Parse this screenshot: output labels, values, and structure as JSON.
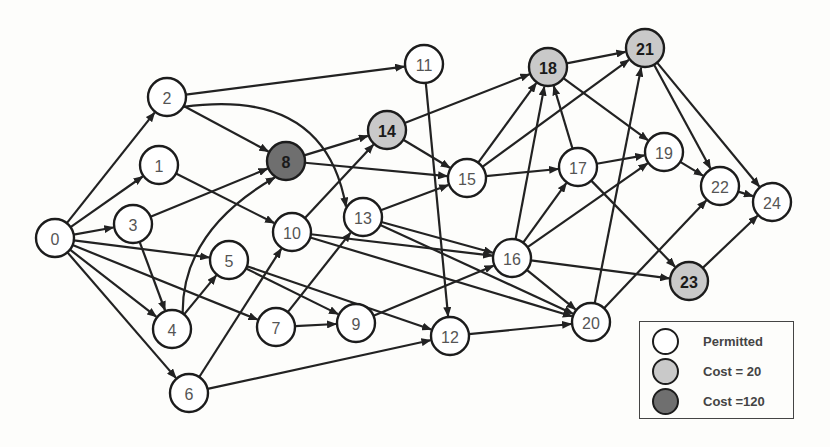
{
  "colors": {
    "permitted": "#ffffff",
    "cost20": "#c9c9c9",
    "cost120": "#6f6f6f",
    "edge": "#222222"
  },
  "nodes": [
    {
      "id": "0",
      "x": 55,
      "y": 238,
      "type": "permitted"
    },
    {
      "id": "1",
      "x": 159,
      "y": 165,
      "type": "permitted"
    },
    {
      "id": "2",
      "x": 167,
      "y": 97,
      "type": "permitted"
    },
    {
      "id": "3",
      "x": 133,
      "y": 224,
      "type": "permitted"
    },
    {
      "id": "4",
      "x": 172,
      "y": 329,
      "type": "permitted"
    },
    {
      "id": "5",
      "x": 229,
      "y": 260,
      "type": "permitted"
    },
    {
      "id": "6",
      "x": 189,
      "y": 393,
      "type": "permitted"
    },
    {
      "id": "7",
      "x": 276,
      "y": 327,
      "type": "permitted"
    },
    {
      "id": "8",
      "x": 286,
      "y": 161,
      "type": "cost120"
    },
    {
      "id": "9",
      "x": 356,
      "y": 323,
      "type": "permitted"
    },
    {
      "id": "10",
      "x": 292,
      "y": 232,
      "type": "permitted"
    },
    {
      "id": "11",
      "x": 424,
      "y": 64,
      "type": "permitted"
    },
    {
      "id": "12",
      "x": 450,
      "y": 336,
      "type": "permitted"
    },
    {
      "id": "13",
      "x": 363,
      "y": 217,
      "type": "permitted"
    },
    {
      "id": "14",
      "x": 387,
      "y": 130,
      "type": "cost20"
    },
    {
      "id": "15",
      "x": 467,
      "y": 178,
      "type": "permitted"
    },
    {
      "id": "16",
      "x": 512,
      "y": 258,
      "type": "permitted"
    },
    {
      "id": "17",
      "x": 578,
      "y": 167,
      "type": "permitted"
    },
    {
      "id": "18",
      "x": 548,
      "y": 67,
      "type": "cost20"
    },
    {
      "id": "19",
      "x": 664,
      "y": 152,
      "type": "permitted"
    },
    {
      "id": "20",
      "x": 591,
      "y": 322,
      "type": "permitted"
    },
    {
      "id": "21",
      "x": 645,
      "y": 48,
      "type": "cost20"
    },
    {
      "id": "22",
      "x": 720,
      "y": 186,
      "type": "permitted"
    },
    {
      "id": "23",
      "x": 689,
      "y": 281,
      "type": "cost20"
    },
    {
      "id": "24",
      "x": 772,
      "y": 202,
      "type": "permitted"
    }
  ],
  "edges": [
    [
      "0",
      "1"
    ],
    [
      "0",
      "2"
    ],
    [
      "0",
      "3"
    ],
    [
      "0",
      "4"
    ],
    [
      "0",
      "5"
    ],
    [
      "0",
      "6"
    ],
    [
      "0",
      "7"
    ],
    [
      "1",
      "10"
    ],
    [
      "2",
      "8"
    ],
    [
      "2",
      "11"
    ],
    [
      "2",
      "13",
      "curve"
    ],
    [
      "3",
      "8"
    ],
    [
      "3",
      "4"
    ],
    [
      "4",
      "5"
    ],
    [
      "4",
      "8",
      "curve"
    ],
    [
      "5",
      "9"
    ],
    [
      "5",
      "12"
    ],
    [
      "6",
      "10"
    ],
    [
      "6",
      "12"
    ],
    [
      "7",
      "9"
    ],
    [
      "7",
      "13"
    ],
    [
      "8",
      "14"
    ],
    [
      "8",
      "15"
    ],
    [
      "9",
      "16"
    ],
    [
      "10",
      "14"
    ],
    [
      "10",
      "16"
    ],
    [
      "10",
      "20"
    ],
    [
      "11",
      "12"
    ],
    [
      "12",
      "20"
    ],
    [
      "13",
      "15"
    ],
    [
      "13",
      "16"
    ],
    [
      "13",
      "20"
    ],
    [
      "14",
      "15"
    ],
    [
      "14",
      "18"
    ],
    [
      "15",
      "17"
    ],
    [
      "15",
      "18"
    ],
    [
      "15",
      "21"
    ],
    [
      "16",
      "17"
    ],
    [
      "16",
      "18"
    ],
    [
      "16",
      "19"
    ],
    [
      "16",
      "20"
    ],
    [
      "16",
      "23"
    ],
    [
      "17",
      "18"
    ],
    [
      "17",
      "19"
    ],
    [
      "17",
      "23"
    ],
    [
      "18",
      "19"
    ],
    [
      "18",
      "21"
    ],
    [
      "19",
      "22"
    ],
    [
      "20",
      "21"
    ],
    [
      "20",
      "22"
    ],
    [
      "21",
      "22"
    ],
    [
      "21",
      "24"
    ],
    [
      "22",
      "24"
    ],
    [
      "23",
      "24"
    ]
  ],
  "legend": {
    "items": [
      {
        "label": "Permitted",
        "type": "permitted"
      },
      {
        "label": "Cost = 20",
        "type": "cost20"
      },
      {
        "label": "Cost =120",
        "type": "cost120"
      }
    ]
  }
}
